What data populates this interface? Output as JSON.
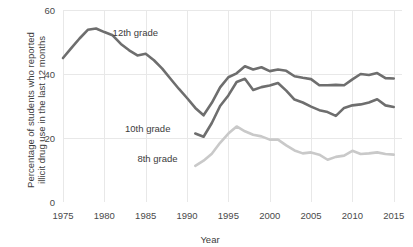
{
  "chart_data": {
    "type": "line",
    "title": "",
    "xlabel": "Year",
    "ylabel": "Percentage of students who reported illicit drug use in the last 12 months",
    "ylabel_line1": "Percentage of students who reported",
    "ylabel_line2": "illicit drug use in the last 12 months",
    "xlim": [
      1975,
      2016
    ],
    "ylim": [
      0,
      62
    ],
    "grid": true,
    "legend_position": "inline-annotations",
    "xticks": [
      1975,
      1980,
      1985,
      1990,
      1995,
      2000,
      2005,
      2010,
      2015
    ],
    "xtick_labels": [
      "1975",
      "1980",
      "1985",
      "1990",
      "1995",
      "2000",
      "2005",
      "2010",
      "2015"
    ],
    "yticks": [
      0,
      20,
      40,
      60
    ],
    "ytick_labels": [
      "0",
      "20",
      "40",
      "60"
    ],
    "colors": {
      "grade12": "#6e6e6e",
      "grade10": "#6e6e6e",
      "grade8": "#c9c9c9",
      "gridline": "#e8e8e8",
      "text": "#3c3c3c",
      "background": "#ffffff"
    },
    "series": [
      {
        "name": "12th grade",
        "label": "12th grade",
        "color": "#6e6e6e",
        "x": [
          1975,
          1976,
          1977,
          1978,
          1979,
          1980,
          1981,
          1982,
          1983,
          1984,
          1985,
          1986,
          1987,
          1988,
          1989,
          1990,
          1991,
          1992,
          1993,
          1994,
          1995,
          1996,
          1997,
          1998,
          1999,
          2000,
          2001,
          2002,
          2003,
          2004,
          2005,
          2006,
          2007,
          2008,
          2009,
          2010,
          2011,
          2012,
          2013,
          2014,
          2015
        ],
        "values": [
          45.0,
          48.1,
          51.1,
          53.8,
          54.2,
          53.1,
          52.1,
          49.4,
          47.4,
          45.8,
          46.3,
          44.3,
          41.7,
          38.5,
          35.4,
          32.5,
          29.4,
          27.1,
          31.0,
          35.8,
          39.0,
          40.2,
          42.4,
          41.4,
          42.1,
          40.9,
          41.4,
          41.0,
          39.3,
          38.8,
          38.4,
          36.5,
          36.5,
          36.6,
          36.5,
          38.3,
          40.0,
          39.7,
          40.3,
          38.7,
          38.6
        ]
      },
      {
        "name": "10th grade",
        "label": "10th grade",
        "color": "#6e6e6e",
        "x": [
          1991,
          1992,
          1993,
          1994,
          1995,
          1996,
          1997,
          1998,
          1999,
          2000,
          2001,
          2002,
          2003,
          2004,
          2005,
          2006,
          2007,
          2008,
          2009,
          2010,
          2011,
          2012,
          2013,
          2014,
          2015
        ],
        "values": [
          21.4,
          20.4,
          24.7,
          30.0,
          33.3,
          37.5,
          38.5,
          35.0,
          35.9,
          36.4,
          37.2,
          34.8,
          32.0,
          31.1,
          29.8,
          28.7,
          28.1,
          26.9,
          29.4,
          30.2,
          30.5,
          31.1,
          32.1,
          30.2,
          29.7
        ]
      },
      {
        "name": "8th grade",
        "label": "8th grade",
        "color": "#c9c9c9",
        "x": [
          1991,
          1992,
          1993,
          1994,
          1995,
          1996,
          1997,
          1998,
          1999,
          2000,
          2001,
          2002,
          2003,
          2004,
          2005,
          2006,
          2007,
          2008,
          2009,
          2010,
          2011,
          2012,
          2013,
          2014,
          2015
        ],
        "values": [
          11.3,
          12.9,
          15.1,
          18.5,
          21.4,
          23.6,
          22.1,
          21.0,
          20.5,
          19.5,
          19.5,
          17.7,
          16.1,
          15.2,
          15.5,
          14.8,
          13.2,
          14.1,
          14.5,
          16.0,
          15.0,
          15.2,
          15.5,
          15.0,
          14.8
        ]
      }
    ],
    "annotations": [
      {
        "text": "12th grade",
        "x": 1981.0,
        "y": 52.0
      },
      {
        "text": "10th grade",
        "x": 1982.5,
        "y": 22.0
      },
      {
        "text": "8th grade",
        "x": 1984.0,
        "y": 12.5
      }
    ]
  }
}
